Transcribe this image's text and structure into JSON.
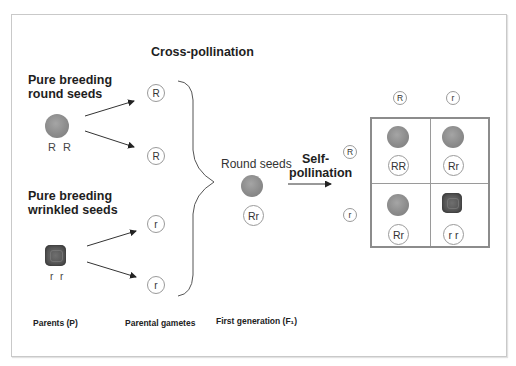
{
  "diagram": {
    "title_cross": "Cross-pollination",
    "parents": {
      "round_heading_line1": "Pure breeding",
      "round_heading_line2": "round seeds",
      "round_genotype": "R R",
      "wrinkled_heading_line1": "Pure breeding",
      "wrinkled_heading_line2": "wrinkled seeds",
      "wrinkled_genotype": "r r"
    },
    "gametes": [
      "R",
      "R",
      "r",
      "r"
    ],
    "f1": {
      "label": "Round seeds",
      "genotype": "Rr"
    },
    "self_pollination": {
      "line1": "Self-",
      "line2": "pollination"
    },
    "punnett": {
      "col_headers": [
        "R",
        "r"
      ],
      "row_headers": [
        "R",
        "r"
      ],
      "cells": [
        {
          "genotype": "RR",
          "phenotype": "round"
        },
        {
          "genotype": "Rr",
          "phenotype": "round"
        },
        {
          "genotype": "Rr",
          "phenotype": "round"
        },
        {
          "genotype": "r r",
          "phenotype": "wrinkled"
        }
      ]
    },
    "footer": {
      "parents": "Parents (P)",
      "gametes": "Parental gametes",
      "first_generation": "First generation (F₁)"
    },
    "colors": {
      "round_seed": "#8c8c8c",
      "wrinkled_seed": "#555555",
      "lines": "#333333",
      "frame": "#c9c9c9"
    }
  }
}
